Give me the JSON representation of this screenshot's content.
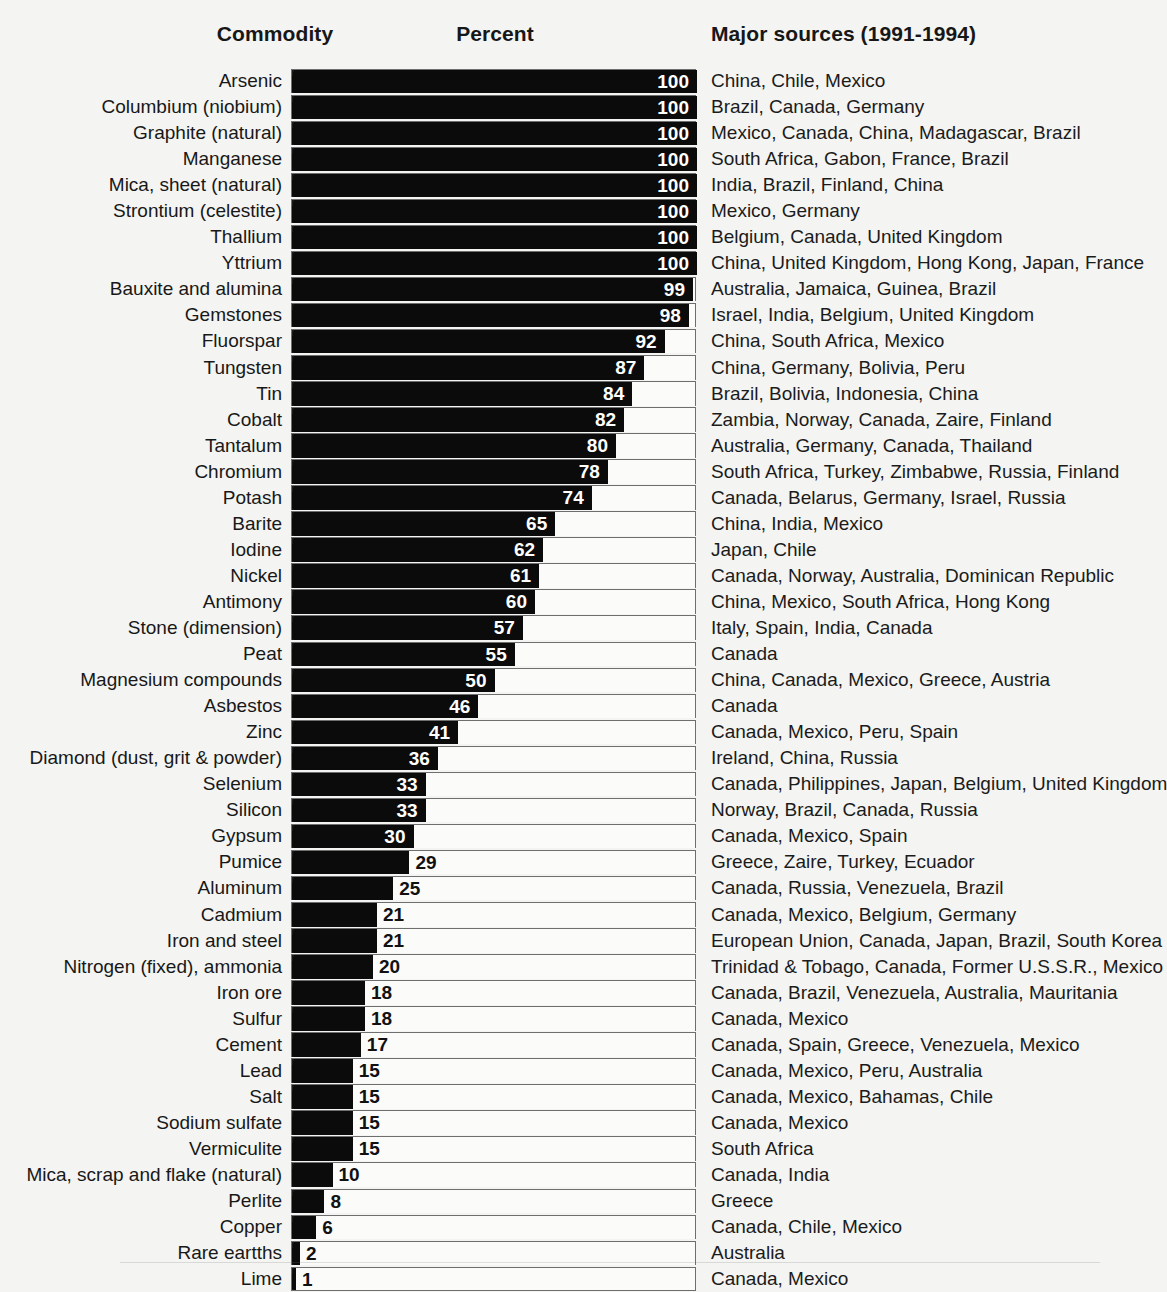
{
  "headers": {
    "commodity": "Commodity",
    "percent": "Percent",
    "sources": "Major sources (1991-1994)"
  },
  "chart_data": {
    "type": "bar",
    "orientation": "horizontal",
    "title": "",
    "xlabel": "Percent",
    "ylabel": "Commodity",
    "xlim": [
      0,
      100
    ],
    "grid": false,
    "legend": null,
    "bar_color": "#0b0b0b",
    "categories": [
      "Arsenic",
      "Columbium (niobium)",
      "Graphite (natural)",
      "Manganese",
      "Mica, sheet (natural)",
      "Strontium (celestite)",
      "Thallium",
      "Yttrium",
      "Bauxite and alumina",
      "Gemstones",
      "Fluorspar",
      "Tungsten",
      "Tin",
      "Cobalt",
      "Tantalum",
      "Chromium",
      "Potash",
      "Barite",
      "Iodine",
      "Nickel",
      "Antimony",
      "Stone (dimension)",
      "Peat",
      "Magnesium compounds",
      "Asbestos",
      "Zinc",
      "Diamond (dust, grit & powder)",
      "Selenium",
      "Silicon",
      "Gypsum",
      "Pumice",
      "Aluminum",
      "Cadmium",
      "Iron and steel",
      "Nitrogen (fixed), ammonia",
      "Iron ore",
      "Sulfur",
      "Cement",
      "Lead",
      "Salt",
      "Sodium sulfate",
      "Vermiculite",
      "Mica, scrap and flake (natural)",
      "Perlite",
      "Copper",
      "Rare eartths",
      "Lime"
    ],
    "values": [
      100,
      100,
      100,
      100,
      100,
      100,
      100,
      100,
      99,
      98,
      92,
      87,
      84,
      82,
      80,
      78,
      74,
      65,
      62,
      61,
      60,
      57,
      55,
      50,
      46,
      41,
      36,
      33,
      33,
      30,
      29,
      25,
      21,
      21,
      20,
      18,
      18,
      17,
      15,
      15,
      15,
      15,
      10,
      8,
      6,
      2,
      1
    ],
    "major_sources": [
      "China, Chile, Mexico",
      "Brazil, Canada, Germany",
      "Mexico, Canada, China, Madagascar, Brazil",
      "South Africa, Gabon, France, Brazil",
      "India, Brazil, Finland, China",
      "Mexico, Germany",
      "Belgium, Canada, United Kingdom",
      "China, United Kingdom, Hong Kong, Japan, France",
      "Australia, Jamaica, Guinea, Brazil",
      "Israel, India, Belgium, United Kingdom",
      "China, South Africa, Mexico",
      "China, Germany, Bolivia, Peru",
      "Brazil, Bolivia, Indonesia, China",
      "Zambia, Norway, Canada, Zaire, Finland",
      "Australia, Germany, Canada, Thailand",
      "South Africa, Turkey, Zimbabwe, Russia, Finland",
      "Canada, Belarus, Germany, Israel, Russia",
      "China, India, Mexico",
      "Japan, Chile",
      "Canada, Norway, Australia, Dominican Republic",
      "China, Mexico, South Africa, Hong Kong",
      "Italy, Spain, India, Canada",
      "Canada",
      "China, Canada, Mexico, Greece, Austria",
      "Canada",
      "Canada, Mexico, Peru, Spain",
      "Ireland, China, Russia",
      "Canada, Philippines, Japan, Belgium, United Kingdom",
      "Norway, Brazil, Canada, Russia",
      "Canada, Mexico, Spain",
      "Greece, Zaire, Turkey, Ecuador",
      "Canada, Russia, Venezuela, Brazil",
      "Canada, Mexico, Belgium, Germany",
      "European Union, Canada, Japan, Brazil, South Korea",
      "Trinidad & Tobago, Canada, Former U.S.S.R., Mexico",
      "Canada, Brazil, Venezuela, Australia, Mauritania",
      "Canada, Mexico",
      "Canada, Spain, Greece, Venezuela, Mexico",
      "Canada, Mexico, Peru, Australia",
      "Canada, Mexico, Bahamas, Chile",
      "Canada, Mexico",
      "South Africa",
      "Canada, India",
      "Greece",
      "Canada, Chile, Mexico",
      "Australia",
      "Canada, Mexico"
    ]
  }
}
